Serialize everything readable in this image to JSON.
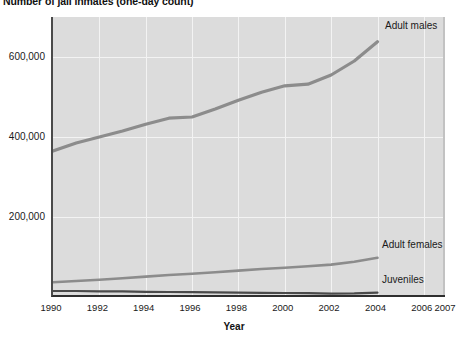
{
  "chart_data": {
    "type": "line",
    "title": "Number of jail inmates (one-day count)",
    "xlabel": "Year",
    "ylabel": "",
    "xlim": [
      1990,
      2007
    ],
    "ylim": [
      0,
      700000
    ],
    "grid": true,
    "legend_position": "inline-right-of-series",
    "x_ticks": [
      "1990",
      "1992",
      "1994",
      "1996",
      "1998",
      "2000",
      "2002",
      "2004",
      "2006",
      "2007"
    ],
    "x_tick_values": [
      1990,
      1992,
      1994,
      1996,
      1998,
      2000,
      2002,
      2004,
      2006,
      2007
    ],
    "y_ticks": [
      "200,000",
      "400,000",
      "600,000"
    ],
    "y_tick_values": [
      200000,
      400000,
      600000
    ],
    "x": [
      1990,
      1991,
      1992,
      1993,
      1994,
      1995,
      1996,
      1997,
      1998,
      1999,
      2000,
      2001,
      2002,
      2003,
      2004
    ],
    "series": [
      {
        "name": "Adult males",
        "color": "#8c8c8c",
        "values": [
          365000,
          385000,
          400000,
          415000,
          432000,
          447000,
          450000,
          470000,
          492000,
          512000,
          528000,
          532000,
          555000,
          590000,
          638000
        ]
      },
      {
        "name": "Adult females",
        "color": "#8c8c8c",
        "values": [
          37000,
          40000,
          43000,
          47000,
          51000,
          55000,
          58000,
          62000,
          66000,
          70000,
          73000,
          77000,
          81000,
          88000,
          98000
        ]
      },
      {
        "name": "Juveniles",
        "color": "#4a4a4a",
        "values": [
          15000,
          15000,
          14000,
          14000,
          13000,
          12500,
          12000,
          11500,
          11000,
          10500,
          10000,
          9500,
          8500,
          9000,
          11000
        ]
      }
    ],
    "colors": {
      "plot_background": "#dcdcdc",
      "gridline": "#f3f3f3",
      "axis": "#2e2e2e",
      "text": "#1a1a1a"
    }
  }
}
